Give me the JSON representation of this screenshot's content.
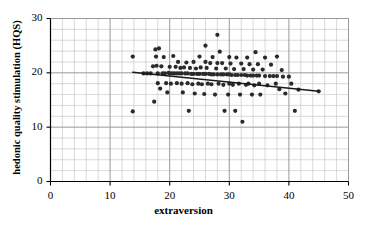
{
  "chart_data": {
    "type": "scatter",
    "title": "",
    "xlabel": "extraversion",
    "ylabel": "hedonic quality stimulation (HQS)",
    "xlim": [
      0,
      50
    ],
    "ylim": [
      0,
      30
    ],
    "xticks": [
      0,
      10,
      20,
      30,
      40,
      50
    ],
    "yticks": [
      0,
      10,
      20,
      30
    ],
    "x_minor_step": 2,
    "y_minor_step": 2,
    "grid": true,
    "legend": "none",
    "marker_color": "#2a2a2a",
    "marker_shape": "circle",
    "axis_color": "#000000",
    "grid_major_color": "#9a9a9a",
    "grid_minor_color": "#c8c8c8",
    "trendline": {
      "name": "linear fit",
      "color": "#1a1a1a",
      "x_start": 13.8,
      "y_start": 20.1,
      "x_end": 45.0,
      "y_end": 16.6,
      "slope": -0.112,
      "intercept": 21.65
    },
    "points": [
      [
        13.8,
        23.0
      ],
      [
        13.8,
        12.9
      ],
      [
        15.6,
        19.9
      ],
      [
        16.2,
        19.9
      ],
      [
        16.8,
        19.9
      ],
      [
        17.2,
        21.2
      ],
      [
        17.4,
        14.7
      ],
      [
        17.6,
        24.3
      ],
      [
        17.7,
        23.0
      ],
      [
        17.8,
        21.3
      ],
      [
        18.0,
        19.9
      ],
      [
        18.0,
        18.1
      ],
      [
        18.2,
        24.5
      ],
      [
        18.4,
        17.1
      ],
      [
        18.6,
        21.2
      ],
      [
        18.8,
        19.9
      ],
      [
        19.0,
        22.9
      ],
      [
        19.2,
        19.9
      ],
      [
        19.4,
        18.1
      ],
      [
        19.6,
        16.4
      ],
      [
        19.8,
        20.0
      ],
      [
        20.0,
        21.1
      ],
      [
        20.0,
        19.9
      ],
      [
        20.2,
        18.0
      ],
      [
        20.4,
        19.9
      ],
      [
        20.6,
        23.1
      ],
      [
        20.8,
        19.9
      ],
      [
        21.0,
        21.1
      ],
      [
        21.2,
        19.9
      ],
      [
        21.2,
        18.1
      ],
      [
        21.4,
        22.0
      ],
      [
        21.6,
        19.9
      ],
      [
        21.8,
        20.9
      ],
      [
        22.0,
        19.9
      ],
      [
        22.0,
        18.0
      ],
      [
        22.2,
        16.4
      ],
      [
        22.4,
        21.0
      ],
      [
        22.6,
        19.9
      ],
      [
        22.8,
        21.9
      ],
      [
        23.0,
        19.9
      ],
      [
        23.0,
        18.1
      ],
      [
        23.2,
        13.0
      ],
      [
        23.4,
        20.9
      ],
      [
        23.6,
        19.8
      ],
      [
        23.8,
        17.9
      ],
      [
        24.0,
        22.0
      ],
      [
        24.0,
        19.8
      ],
      [
        24.2,
        16.2
      ],
      [
        24.4,
        20.8
      ],
      [
        24.6,
        19.8
      ],
      [
        24.8,
        18.0
      ],
      [
        25.0,
        23.0
      ],
      [
        25.0,
        19.8
      ],
      [
        25.2,
        21.0
      ],
      [
        25.4,
        17.9
      ],
      [
        25.6,
        19.8
      ],
      [
        25.8,
        16.1
      ],
      [
        26.0,
        25.0
      ],
      [
        26.0,
        22.0
      ],
      [
        26.0,
        19.8
      ],
      [
        26.2,
        20.9
      ],
      [
        26.4,
        18.0
      ],
      [
        26.6,
        19.8
      ],
      [
        26.8,
        21.8
      ],
      [
        27.0,
        19.7
      ],
      [
        27.0,
        17.9
      ],
      [
        27.2,
        22.9
      ],
      [
        27.4,
        19.7
      ],
      [
        27.6,
        16.0
      ],
      [
        27.8,
        20.8
      ],
      [
        28.0,
        27.0
      ],
      [
        28.0,
        21.8
      ],
      [
        28.0,
        19.7
      ],
      [
        28.2,
        18.0
      ],
      [
        28.4,
        23.9
      ],
      [
        28.6,
        19.7
      ],
      [
        28.8,
        21.8
      ],
      [
        29.0,
        19.7
      ],
      [
        29.0,
        17.8
      ],
      [
        29.2,
        13.0
      ],
      [
        29.4,
        20.8
      ],
      [
        29.6,
        19.7
      ],
      [
        29.8,
        16.0
      ],
      [
        30.0,
        22.9
      ],
      [
        30.0,
        19.7
      ],
      [
        30.0,
        18.0
      ],
      [
        30.2,
        21.7
      ],
      [
        30.4,
        19.6
      ],
      [
        30.6,
        17.8
      ],
      [
        30.8,
        20.7
      ],
      [
        31.0,
        19.6
      ],
      [
        31.0,
        13.0
      ],
      [
        31.2,
        22.8
      ],
      [
        31.4,
        19.6
      ],
      [
        31.6,
        18.0
      ],
      [
        31.8,
        16.0
      ],
      [
        32.0,
        21.7
      ],
      [
        32.0,
        19.6
      ],
      [
        32.2,
        11.0
      ],
      [
        32.4,
        20.7
      ],
      [
        32.6,
        19.6
      ],
      [
        32.8,
        17.8
      ],
      [
        33.0,
        22.8
      ],
      [
        33.0,
        19.5
      ],
      [
        33.2,
        18.0
      ],
      [
        33.4,
        21.6
      ],
      [
        33.6,
        19.5
      ],
      [
        33.8,
        16.0
      ],
      [
        34.0,
        20.6
      ],
      [
        34.0,
        19.5
      ],
      [
        34.2,
        17.7
      ],
      [
        34.4,
        23.8
      ],
      [
        34.6,
        19.5
      ],
      [
        34.8,
        21.6
      ],
      [
        35.0,
        19.5
      ],
      [
        35.0,
        18.0
      ],
      [
        35.2,
        16.0
      ],
      [
        35.6,
        20.6
      ],
      [
        36.0,
        22.8
      ],
      [
        36.0,
        19.4
      ],
      [
        36.4,
        17.7
      ],
      [
        36.8,
        19.4
      ],
      [
        37.0,
        21.5
      ],
      [
        37.4,
        19.4
      ],
      [
        37.8,
        18.0
      ],
      [
        38.0,
        23.0
      ],
      [
        38.0,
        19.4
      ],
      [
        38.4,
        17.0
      ],
      [
        38.8,
        20.5
      ],
      [
        39.0,
        19.3
      ],
      [
        39.4,
        16.2
      ],
      [
        40.0,
        19.3
      ],
      [
        40.4,
        18.0
      ],
      [
        41.0,
        13.0
      ],
      [
        41.6,
        16.9
      ],
      [
        45.0,
        16.6
      ]
    ]
  }
}
